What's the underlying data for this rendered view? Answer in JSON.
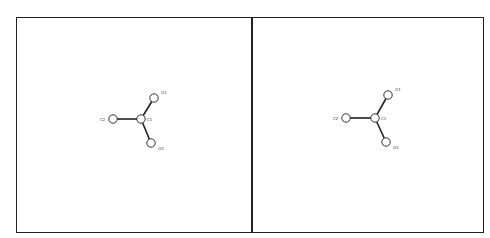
{
  "diagram": {
    "type": "molecule-structure",
    "panels": [
      {
        "name": "left",
        "atoms": [
          {
            "id": "C1",
            "label": "C1",
            "x": 141,
            "y": 119,
            "lx": 147,
            "ly": 121
          },
          {
            "id": "C2",
            "label": "C2",
            "x": 113,
            "y": 119,
            "lx": 100,
            "ly": 121
          },
          {
            "id": "O1",
            "label": "O1",
            "x": 154,
            "y": 98,
            "lx": 161,
            "ly": 94
          },
          {
            "id": "O2",
            "label": "O2",
            "x": 151,
            "y": 143,
            "lx": 158,
            "ly": 150
          }
        ],
        "bonds": [
          [
            "C1",
            "C2"
          ],
          [
            "C1",
            "O1"
          ],
          [
            "C1",
            "O2"
          ]
        ]
      },
      {
        "name": "right",
        "atoms": [
          {
            "id": "C1",
            "label": "C1",
            "x": 375,
            "y": 118,
            "lx": 381,
            "ly": 120
          },
          {
            "id": "C2",
            "label": "C2",
            "x": 346,
            "y": 118,
            "lx": 333,
            "ly": 120
          },
          {
            "id": "O1",
            "label": "O1",
            "x": 388,
            "y": 95,
            "lx": 395,
            "ly": 91
          },
          {
            "id": "O2",
            "label": "O2",
            "x": 386,
            "y": 142,
            "lx": 393,
            "ly": 149
          }
        ],
        "bonds": [
          [
            "C1",
            "C2"
          ],
          [
            "C1",
            "O1"
          ],
          [
            "C1",
            "O2"
          ]
        ]
      }
    ],
    "colors": {
      "bond": "#222222",
      "atom_stroke": "#333333",
      "atom_fill": "#ffffff",
      "frame": "#222222"
    }
  }
}
